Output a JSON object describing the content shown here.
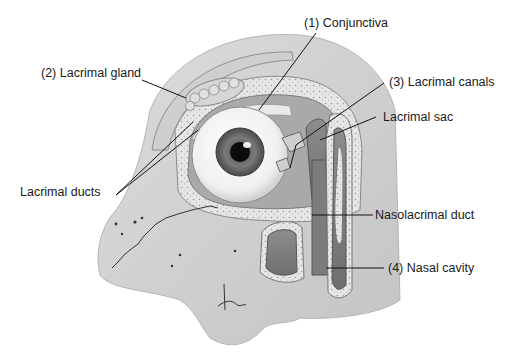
{
  "diagram": {
    "labels": [
      {
        "id": "conjunctiva",
        "text": "(1) Conjunctiva",
        "x": 304,
        "y": 17
      },
      {
        "id": "lacrimal-gland",
        "text": "(2) Lacrimal gland",
        "x": 41,
        "y": 67
      },
      {
        "id": "lacrimal-canals",
        "text": "(3) Lacrimal canals",
        "x": 389,
        "y": 76
      },
      {
        "id": "lacrimal-sac",
        "text": "Lacrimal sac",
        "x": 383,
        "y": 111
      },
      {
        "id": "lacrimal-ducts",
        "text": "Lacrimal ducts",
        "x": 20,
        "y": 186
      },
      {
        "id": "nasolacrimal-duct",
        "text": "Nasolacrimal duct",
        "x": 375,
        "y": 209
      },
      {
        "id": "nasal-cavity",
        "text": "(4) Nasal cavity",
        "x": 388,
        "y": 262
      }
    ],
    "signature": "tina",
    "colors": {
      "text": "#1a1a1a",
      "leader": "#111111",
      "bone": "#d8d8d8",
      "tissue": "#bdbdbd",
      "cavity": "#8a8a8a",
      "sclera": "#f4f4f4",
      "iris": "#6e6e6e",
      "pupil": "#0a0a0a"
    }
  }
}
